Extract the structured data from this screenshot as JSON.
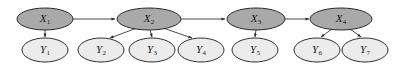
{
  "figure": {
    "type": "directed-graph",
    "title": "",
    "background_color": "#ffffff",
    "width": 402,
    "height": 68
  },
  "style": {
    "hidden_node_fill": "#a9a9a9",
    "observed_node_fill": "#ececec",
    "node_stroke": "#1a1a1a",
    "edge_color": "#2a2a2a",
    "label_color": "#1a1a1a"
  },
  "nodes": {
    "hidden": [
      {
        "id": "X1",
        "base": "X",
        "sub": "1",
        "cx": 45,
        "cy": 19,
        "rx": 28,
        "ry": 11,
        "fill": "#a9a9a9"
      },
      {
        "id": "X2",
        "base": "X",
        "sub": "2",
        "cx": 149,
        "cy": 19,
        "rx": 32,
        "ry": 11,
        "fill": "#a9a9a9"
      },
      {
        "id": "X3",
        "base": "X",
        "sub": "3",
        "cx": 256,
        "cy": 19,
        "rx": 29,
        "ry": 11,
        "fill": "#a9a9a9"
      },
      {
        "id": "X4",
        "base": "X",
        "sub": "4",
        "cx": 341,
        "cy": 19,
        "rx": 31,
        "ry": 11,
        "fill": "#a9a9a9"
      }
    ],
    "observed": [
      {
        "id": "Y1",
        "base": "Y",
        "sub": "1",
        "cx": 45,
        "cy": 50,
        "rx": 23,
        "ry": 12,
        "fill": "#ececec"
      },
      {
        "id": "Y2",
        "base": "Y",
        "sub": "2",
        "cx": 101,
        "cy": 50,
        "rx": 23,
        "ry": 12,
        "fill": "#ececec"
      },
      {
        "id": "Y3",
        "base": "Y",
        "sub": "3",
        "cx": 152,
        "cy": 50,
        "rx": 23,
        "ry": 12,
        "fill": "#ececec"
      },
      {
        "id": "Y4",
        "base": "Y",
        "sub": "4",
        "cx": 201,
        "cy": 50,
        "rx": 23,
        "ry": 12,
        "fill": "#ececec"
      },
      {
        "id": "Y5",
        "base": "Y",
        "sub": "5",
        "cx": 255,
        "cy": 50,
        "rx": 23,
        "ry": 12,
        "fill": "#ececec"
      },
      {
        "id": "Y6",
        "base": "Y",
        "sub": "6",
        "cx": 317,
        "cy": 50,
        "rx": 23,
        "ry": 12,
        "fill": "#ececec"
      },
      {
        "id": "Y7",
        "base": "Y",
        "sub": "7",
        "cx": 365,
        "cy": 50,
        "rx": 23,
        "ry": 12,
        "fill": "#ececec"
      }
    ]
  },
  "edges": [
    {
      "id": "X1-X2",
      "from": "X1",
      "to": "X2",
      "kind": "transition",
      "x1": 73,
      "y1": 19,
      "x2": 115,
      "y2": 19
    },
    {
      "id": "X2-X3",
      "from": "X2",
      "to": "X3",
      "kind": "transition",
      "x1": 181,
      "y1": 19,
      "x2": 225,
      "y2": 19
    },
    {
      "id": "X3-X4",
      "from": "X3",
      "to": "X4",
      "kind": "transition",
      "x1": 285,
      "y1": 19,
      "x2": 309,
      "y2": 19
    },
    {
      "id": "X1-Y1",
      "from": "X1",
      "to": "Y1",
      "kind": "emission",
      "x1": 45,
      "y1": 30,
      "x2": 45,
      "y2": 37
    },
    {
      "id": "X2-Y2",
      "from": "X2",
      "to": "Y2",
      "kind": "emission",
      "x1": 137,
      "y1": 28,
      "x2": 110,
      "y2": 38
    },
    {
      "id": "X2-Y3",
      "from": "X2",
      "to": "Y3",
      "kind": "emission",
      "x1": 150,
      "y1": 30,
      "x2": 152,
      "y2": 37
    },
    {
      "id": "X2-Y4",
      "from": "X2",
      "to": "Y4",
      "kind": "emission",
      "x1": 163,
      "y1": 28,
      "x2": 192,
      "y2": 38
    },
    {
      "id": "X3-Y5",
      "from": "X3",
      "to": "Y5",
      "kind": "emission",
      "x1": 256,
      "y1": 30,
      "x2": 255,
      "y2": 37
    },
    {
      "id": "X4-Y6",
      "from": "X4",
      "to": "Y6",
      "kind": "emission",
      "x1": 332,
      "y1": 29,
      "x2": 321,
      "y2": 37
    },
    {
      "id": "X4-Y7",
      "from": "X4",
      "to": "Y7",
      "kind": "emission",
      "x1": 350,
      "y1": 29,
      "x2": 361,
      "y2": 37
    }
  ]
}
